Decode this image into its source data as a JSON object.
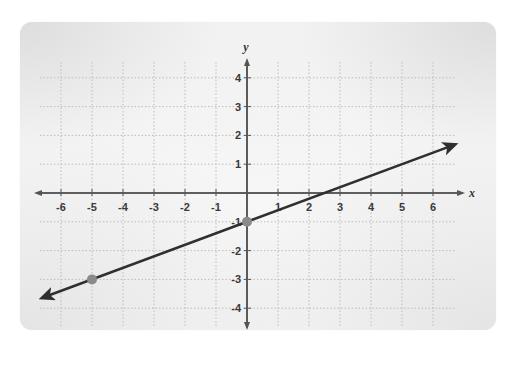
{
  "chart_data": {
    "type": "line",
    "title": "",
    "xlabel": "x",
    "ylabel": "y",
    "xlim": [
      -6,
      6
    ],
    "ylim": [
      -4,
      4
    ],
    "grid": true,
    "grid_style": "dotted",
    "x_ticks": [
      -6,
      -5,
      -4,
      -3,
      -2,
      -1,
      1,
      2,
      3,
      4,
      5,
      6
    ],
    "y_ticks": [
      4,
      3,
      2,
      1,
      -1,
      -2,
      -3,
      -4
    ],
    "x_tick_labels": [
      "-6",
      "-5",
      "-4",
      "-3",
      "-2",
      "-1",
      "1",
      "2",
      "3",
      "4",
      "5",
      "6"
    ],
    "y_tick_labels": [
      "4",
      "3",
      "2",
      "1",
      "-1",
      "-2",
      "-3",
      "-4"
    ],
    "series": [
      {
        "name": "line",
        "equation": "y = 0.4x - 1",
        "slope": 0.4,
        "intercept": -1,
        "arrows": "both",
        "extent_x": [
          -6.6,
          6.7
        ],
        "points": [
          {
            "x": 0,
            "y": -1
          },
          {
            "x": -5,
            "y": -3
          }
        ]
      }
    ],
    "legend": null
  },
  "colors": {
    "line": "#2f2f2f",
    "axis": "#555555",
    "grid": "#bdbdbd",
    "point": "#8a8a8a",
    "label": "#3a3a3a"
  }
}
